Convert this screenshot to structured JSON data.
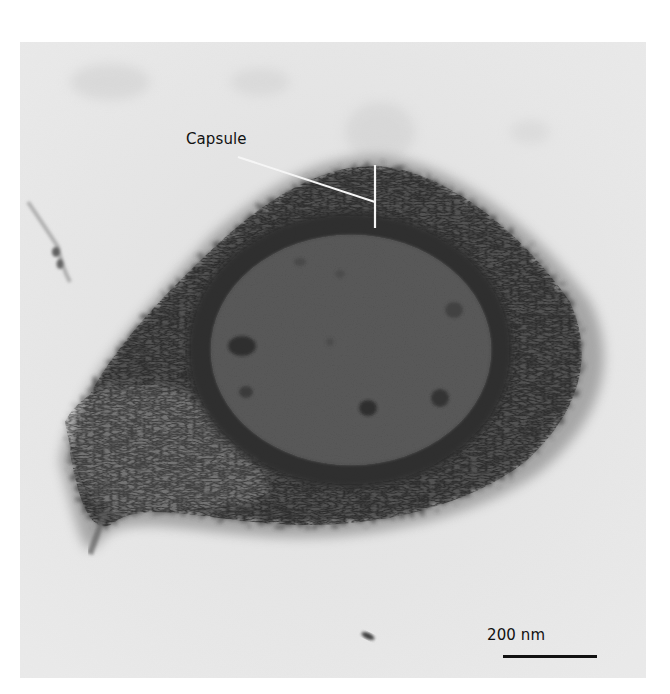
{
  "figure": {
    "type": "transmission electron micrograph",
    "background_color": "#ededed",
    "annotations": {
      "capsule_label": "Capsule",
      "capsule_label_color": "#111111",
      "leader_line_color": "#ffffff"
    },
    "scale_bar": {
      "label": "200 nm",
      "length_px": 94,
      "color": "#111111"
    },
    "structures": {
      "capsule": {
        "color": "#2e2e2e",
        "texture": "fibrous, granular"
      },
      "cell_wall_band": {
        "color": "#1a1a1a"
      },
      "cytoplasm": {
        "color": "#505050",
        "inclusions": 5
      }
    }
  }
}
